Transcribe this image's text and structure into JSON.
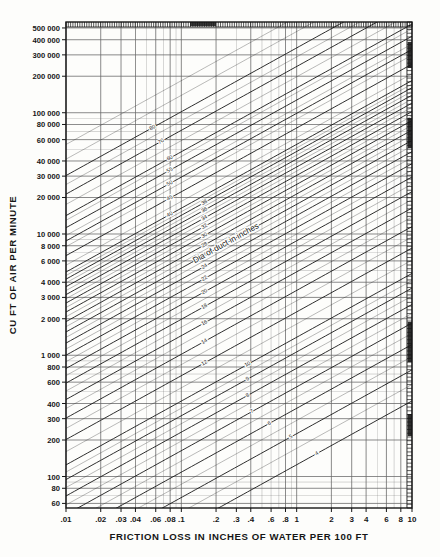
{
  "chart_data": {
    "type": "line",
    "title": "",
    "xlabel": "FRICTION LOSS IN INCHES OF WATER PER 100 FT",
    "ylabel": "CU FT OF AIR PER MINUTE",
    "xscale": "log",
    "yscale": "log",
    "xlim": [
      0.01,
      10
    ],
    "ylim": [
      55,
      560000
    ],
    "grid": true,
    "legend_position": "none",
    "xticks": [
      0.01,
      0.02,
      0.03,
      0.04,
      0.06,
      0.08,
      0.1,
      0.2,
      0.3,
      0.4,
      0.6,
      0.8,
      1,
      2,
      3,
      4,
      6,
      8,
      10
    ],
    "xticklabels": [
      ".01",
      ".02",
      ".03",
      ".04",
      ".06",
      ".08",
      ".1",
      ".2",
      ".3",
      ".4",
      ".6",
      ".8",
      "1",
      "2",
      "3",
      "4",
      "6",
      "8",
      "10"
    ],
    "yticks": [
      60,
      80,
      100,
      200,
      300,
      400,
      600,
      800,
      1000,
      2000,
      3000,
      4000,
      6000,
      8000,
      10000,
      20000,
      30000,
      40000,
      60000,
      80000,
      100000,
      200000,
      300000,
      400000,
      500000
    ],
    "yticklabels": [
      "60",
      "80",
      "100",
      "200",
      "300",
      "400",
      "600",
      "800",
      "1 000",
      "2 000",
      "3 000",
      "4 000",
      "6 000",
      "8 000",
      "10 000",
      "20 000",
      "30 000",
      "40 000",
      "60 000",
      "80 000",
      "100 000",
      "200 000",
      "300 000",
      "400 000",
      "500 000"
    ],
    "series": [
      {
        "name": "Dia of duct in inches",
        "orientation": "up-right",
        "label": "Dia of duct in inches",
        "values": [
          4,
          5,
          6,
          7,
          8,
          9,
          10,
          12,
          14,
          16,
          18,
          20,
          22,
          24,
          26,
          28,
          30,
          32,
          34,
          36,
          38,
          40,
          45,
          50,
          55,
          60,
          70,
          80
        ],
        "labeled": [
          4,
          5,
          6,
          7,
          8,
          9,
          10,
          12,
          14,
          16,
          18,
          20,
          22,
          24,
          26,
          28,
          30,
          32,
          34,
          36,
          38,
          40,
          45,
          50,
          55,
          60,
          70,
          80
        ]
      },
      {
        "name": "Velocity in feet per minute",
        "orientation": "down-right",
        "label": "Velocity is feet per minute",
        "values": [
          300,
          400,
          500,
          600,
          700,
          800,
          900,
          1000,
          1200,
          1400,
          1600,
          1800,
          2000,
          2200,
          2400,
          2600,
          2800,
          3000,
          3200,
          3600,
          4000,
          4500,
          5000,
          5500,
          6000,
          6500,
          7000,
          7500,
          8000,
          10000,
          12000
        ],
        "labeled": [
          300,
          400,
          500,
          600,
          700,
          800,
          900,
          1000,
          1200,
          1400,
          1600,
          1800,
          2000,
          2200,
          2400,
          2600,
          2800,
          3000,
          3200,
          3600,
          4000,
          4500,
          5000,
          5500,
          6000,
          6500,
          7000,
          7500,
          8000,
          10000,
          12000
        ]
      }
    ],
    "annotations": [
      {
        "text": "Dia of duct in inches",
        "family": "diameter"
      },
      {
        "text": "Velocity is feet per minute",
        "family": "velocity"
      }
    ]
  },
  "colors": {
    "ink": "#161616",
    "grid": "#6a6a6a",
    "paper": "#fdfdfb"
  }
}
